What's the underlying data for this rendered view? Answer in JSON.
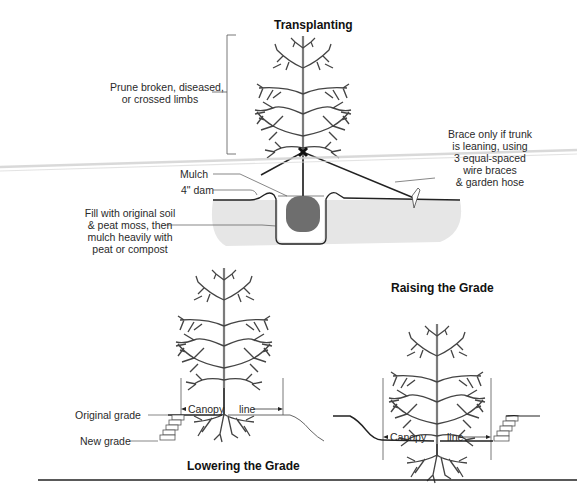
{
  "figure": {
    "transplanting": {
      "title": "Transplanting",
      "labels": {
        "prune_line1": "Prune broken, diseased,",
        "prune_line2": "or crossed limbs",
        "brace_line1": "Brace only if trunk",
        "brace_line2": "is leaning, using",
        "brace_line3": "3 equal-spaced",
        "brace_line4": "wire braces",
        "brace_line5": "& garden hose",
        "mulch": "Mulch",
        "dam": "4\" dam",
        "fill_line1": "Fill with original soil",
        "fill_line2": "& peat moss, then",
        "fill_line3": "mulch heavily with",
        "fill_line4": "peat or compost"
      }
    },
    "lowering": {
      "title": "Lowering the Grade",
      "labels": {
        "original_grade": "Original grade",
        "new_grade": "New grade",
        "canopy": "Canopy",
        "line": "line"
      }
    },
    "raising": {
      "title": "Raising the Grade",
      "labels": {
        "canopy": "Canopy",
        "line": "line"
      }
    }
  },
  "colors": {
    "ink": "#2a2a2a",
    "soil": "#e6e6e6",
    "rootball": "#6e6e6e",
    "rule": "#222222"
  }
}
